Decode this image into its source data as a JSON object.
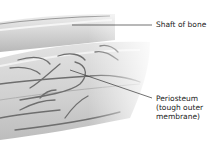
{
  "diagram": {
    "labels": {
      "shaft": "Shaft of bone",
      "periosteum_line1": "Periosteum",
      "periosteum_line2": "(tough outer",
      "periosteum_line3": "membrane)"
    },
    "colors": {
      "background": "#ffffff",
      "bone": "#d9d9d9",
      "bone_shadow": "#a8a8a8",
      "vessel": "#6e6e6e",
      "leader_line": "#333333",
      "text": "#222222"
    }
  }
}
